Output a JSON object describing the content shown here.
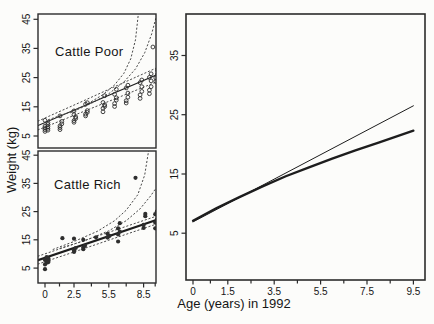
{
  "figure": {
    "ylabel": "Weight (kg)",
    "xlabel": "Age (years) in 1992",
    "bg_color": "#fcfcfa",
    "box_color": "#2b2b2b",
    "line_color": "#1d1d1d",
    "dotted_color": "#4a4a4a",
    "point_color": "#2e2e2e",
    "text_color": "#161616"
  },
  "chart_data": [
    {
      "type": "scatter",
      "name": "cattle-poor",
      "title": "Cattle Poor",
      "xlabel": "",
      "ylabel": "Weight (kg)",
      "xlim": [
        -0.6,
        9.57
      ],
      "ylim": [
        0.9,
        46.8
      ],
      "grid": false,
      "legend": "none",
      "x_ticks": {
        "major": [],
        "minor": [],
        "labels": []
      },
      "y_ticks": {
        "major": [
          5,
          15,
          25,
          35,
          45
        ],
        "labels": [
          "5",
          "15",
          "25",
          "35",
          "45"
        ],
        "rotated": true
      },
      "layout": {
        "box": {
          "left": 38,
          "top": 14,
          "right": 156,
          "bottom": 148
        },
        "box_width": 1.4
      },
      "points": [
        {
          "symbol": "open",
          "r": 1.9,
          "data": [
            [
              0,
              6.6
            ],
            [
              0,
              7.2
            ],
            [
              0,
              7.8
            ],
            [
              0,
              8.4
            ],
            [
              0.25,
              7.0
            ],
            [
              0.25,
              7.6
            ],
            [
              0.25,
              8.2
            ],
            [
              0.25,
              9.0
            ],
            [
              0.25,
              9.6
            ],
            [
              0,
              10.4
            ],
            [
              1.3,
              7.2
            ],
            [
              1.3,
              7.9
            ],
            [
              1.3,
              8.5
            ],
            [
              1.45,
              9.2
            ],
            [
              1.45,
              10.0
            ],
            [
              1.3,
              11.9
            ],
            [
              2.5,
              9.7
            ],
            [
              2.5,
              10.3
            ],
            [
              2.65,
              11.0
            ],
            [
              2.65,
              11.6
            ],
            [
              2.5,
              12.3
            ],
            [
              2.5,
              13.6
            ],
            [
              3.5,
              11.9
            ],
            [
              3.5,
              12.5
            ],
            [
              3.65,
              13.1
            ],
            [
              3.65,
              13.7
            ],
            [
              3.5,
              15.9
            ],
            [
              3.65,
              16.4
            ],
            [
              5,
              13.3
            ],
            [
              5,
              14.5
            ],
            [
              5.15,
              15.1
            ],
            [
              5.15,
              15.7
            ],
            [
              5,
              16.5
            ],
            [
              5.15,
              18.8
            ],
            [
              6,
              15.1
            ],
            [
              6,
              16.1
            ],
            [
              6.15,
              17.3
            ],
            [
              6.15,
              18.1
            ],
            [
              6,
              19.3
            ],
            [
              6.15,
              21.0
            ],
            [
              7,
              16.3
            ],
            [
              7,
              17.1
            ],
            [
              7.15,
              18.3
            ],
            [
              7.15,
              19.7
            ],
            [
              7,
              21.5
            ],
            [
              7.15,
              22.4
            ],
            [
              8.2,
              17.9
            ],
            [
              8.2,
              19.1
            ],
            [
              8.35,
              20.3
            ],
            [
              8.35,
              21.9
            ],
            [
              8.2,
              23.3
            ],
            [
              8.35,
              24.2
            ],
            [
              9,
              19.5
            ],
            [
              9,
              20.7
            ],
            [
              9.15,
              21.9
            ],
            [
              9.15,
              23.9
            ],
            [
              9,
              25.1
            ],
            [
              9.15,
              26.3
            ],
            [
              9.3,
              35.5
            ],
            [
              9.55,
              23.7
            ],
            [
              9.55,
              24.9
            ],
            [
              9.7,
              26.1
            ],
            [
              9.7,
              27.5
            ]
          ]
        }
      ],
      "curves": [
        {
          "name": "fit-line",
          "style": "solid",
          "width": 1.1,
          "points": [
            [
              -0.6,
              8.6
            ],
            [
              9.6,
              25.9
            ]
          ]
        },
        {
          "name": "band-upper",
          "style": "dotted",
          "width": 1,
          "points": [
            [
              -0.6,
              10.1
            ],
            [
              3,
              16.5
            ],
            [
              6,
              21.9
            ],
            [
              9.6,
              28.3
            ]
          ]
        },
        {
          "name": "band-lower",
          "style": "dotted",
          "width": 1,
          "points": [
            [
              -0.6,
              7.1
            ],
            [
              3,
              12.9
            ],
            [
              6,
              17.7
            ],
            [
              9.6,
              23.5
            ]
          ]
        },
        {
          "name": "upper-curve-steep",
          "style": "dotted",
          "width": 1,
          "points": [
            [
              0.3,
              10.6
            ],
            [
              2,
              13.0
            ],
            [
              3.5,
              15.6
            ],
            [
              5,
              19.2
            ],
            [
              6,
              22.5
            ],
            [
              6.8,
              26.5
            ],
            [
              7.4,
              31.5
            ],
            [
              7.8,
              38
            ],
            [
              8.05,
              47
            ]
          ]
        },
        {
          "name": "upper-curve-outer",
          "style": "dotted",
          "width": 1,
          "points": [
            [
              2.2,
              13.0
            ],
            [
              4,
              16.2
            ],
            [
              5.5,
              19.5
            ],
            [
              6.8,
              23.5
            ],
            [
              7.8,
              28
            ],
            [
              8.6,
              33.5
            ],
            [
              9.2,
              40
            ],
            [
              9.6,
              46
            ]
          ]
        }
      ]
    },
    {
      "type": "scatter",
      "name": "cattle-rich",
      "title": "Cattle Rich",
      "xlabel": "",
      "ylabel": "Weight (kg)",
      "xlim": [
        -0.6,
        9.57
      ],
      "ylim": [
        -0.3,
        46.5
      ],
      "grid": false,
      "legend": "none",
      "x_ticks": {
        "major": [
          0,
          2.5,
          5.5,
          8.5
        ],
        "minor": [
          1.25,
          4,
          7,
          9.5
        ],
        "labels": [
          "0",
          "2.5",
          "5.5",
          "8.5"
        ]
      },
      "y_ticks": {
        "major": [
          5,
          15,
          25,
          35,
          45
        ],
        "labels": [
          "5",
          "15",
          "25",
          "35",
          "45"
        ],
        "rotated": true
      },
      "layout": {
        "box": {
          "left": 38,
          "top": 151,
          "right": 156,
          "bottom": 283
        },
        "box_width": 1.4
      },
      "points": [
        {
          "symbol": "filled",
          "r": 2.1,
          "data": [
            [
              0,
              4.6
            ],
            [
              0,
              6.3
            ],
            [
              0.15,
              6.9
            ],
            [
              0.15,
              7.4
            ],
            [
              0,
              7.9
            ],
            [
              0.3,
              7.1
            ],
            [
              0.3,
              7.7
            ],
            [
              0.3,
              8.4
            ],
            [
              0.15,
              8.9
            ],
            [
              1.5,
              15.6
            ],
            [
              2.5,
              10.7
            ],
            [
              2.5,
              11.3
            ],
            [
              2.65,
              12.1
            ],
            [
              2.5,
              15.4
            ],
            [
              3.3,
              11.7
            ],
            [
              3.3,
              12.3
            ],
            [
              3.45,
              12.9
            ],
            [
              3.3,
              15.0
            ],
            [
              4.4,
              15.9
            ],
            [
              5.4,
              15.8
            ],
            [
              5.55,
              16.4
            ],
            [
              5.4,
              17.1
            ],
            [
              6.3,
              14.4
            ],
            [
              6.3,
              16.9
            ],
            [
              6.45,
              17.9
            ],
            [
              6.3,
              19.1
            ],
            [
              6.45,
              20.9
            ],
            [
              7.8,
              37.0
            ],
            [
              8.5,
              19.2
            ],
            [
              8.5,
              20.3
            ],
            [
              8.65,
              23.4
            ],
            [
              8.65,
              24.2
            ],
            [
              9.5,
              19.1
            ],
            [
              9.5,
              21.1
            ],
            [
              9.65,
              22.2
            ],
            [
              9.5,
              24.1
            ],
            [
              9.65,
              25.1
            ]
          ]
        }
      ],
      "curves": [
        {
          "name": "fit-line",
          "style": "solid",
          "width": 2.2,
          "points": [
            [
              -0.6,
              7.8
            ],
            [
              9.6,
              22.0
            ]
          ]
        },
        {
          "name": "band-upper",
          "style": "dotted",
          "width": 1,
          "points": [
            [
              -0.6,
              9.2
            ],
            [
              3,
              14.2
            ],
            [
              6,
              18.4
            ],
            [
              9.6,
              23.4
            ]
          ]
        },
        {
          "name": "band-lower",
          "style": "dotted",
          "width": 1,
          "points": [
            [
              -0.6,
              6.4
            ],
            [
              3,
              11.4
            ],
            [
              6,
              15.6
            ],
            [
              9.6,
              20.6
            ]
          ]
        },
        {
          "name": "upper-curve-steep",
          "style": "dotted",
          "width": 1,
          "points": [
            [
              0.7,
              11.6
            ],
            [
              2.5,
              14.4
            ],
            [
              4.5,
              18.0
            ],
            [
              6,
              21.8
            ],
            [
              7,
              25.5
            ],
            [
              8,
              31
            ],
            [
              8.6,
              38
            ],
            [
              8.95,
              47
            ]
          ]
        },
        {
          "name": "upper-curve-outer",
          "style": "dotted",
          "width": 1,
          "points": [
            [
              1.3,
              12.0
            ],
            [
              3.5,
              14.8
            ],
            [
              5.5,
              18.2
            ],
            [
              7,
              21.8
            ],
            [
              8.2,
              26
            ],
            [
              9.1,
              30.5
            ],
            [
              9.6,
              33.5
            ]
          ]
        }
      ]
    },
    {
      "type": "line",
      "name": "fitted-comparison",
      "title": "",
      "xlabel": "Age (years) in 1992",
      "ylabel": "",
      "xlim": [
        -0.3,
        10.0
      ],
      "ylim": [
        -2.9,
        42.0
      ],
      "grid": false,
      "legend": "none",
      "x_ticks": {
        "major": [
          0,
          1.5,
          3.5,
          5.5,
          7.5,
          9.5
        ],
        "minor": [
          0.75,
          2.5,
          4.5,
          6.5,
          8.5
        ],
        "labels": [
          "0",
          "1.5",
          "3.5",
          "5.5",
          "7.5",
          "9.5"
        ]
      },
      "y_ticks": {
        "major": [
          5,
          15,
          25,
          35
        ],
        "labels": [
          "5",
          "15",
          "25",
          "35"
        ],
        "rotated": true
      },
      "layout": {
        "box": {
          "left": 186,
          "top": 14,
          "right": 425,
          "bottom": 280
        },
        "box_width": 1.6
      },
      "points": [],
      "curves": [
        {
          "name": "poor-fit-thin",
          "style": "solid",
          "width": 1.0,
          "points": [
            [
              0,
              6.9
            ],
            [
              9.5,
              26.5
            ]
          ]
        },
        {
          "name": "rich-fit-thick",
          "style": "solid",
          "width": 2.3,
          "points": [
            [
              0,
              7.1
            ],
            [
              1,
              9.2
            ],
            [
              2,
              11.1
            ],
            [
              3,
              12.9
            ],
            [
              4,
              14.6
            ],
            [
              5,
              16.1
            ],
            [
              6,
              17.6
            ],
            [
              7,
              19.0
            ],
            [
              8,
              20.3
            ],
            [
              9.5,
              22.3
            ]
          ]
        }
      ]
    }
  ]
}
